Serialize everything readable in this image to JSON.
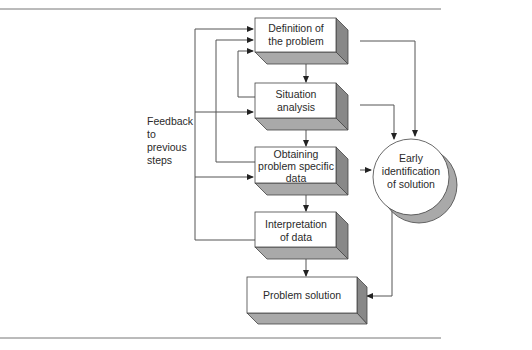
{
  "diagram": {
    "boxes": [
      {
        "id": "definition",
        "lines": [
          "Definition of",
          "the problem"
        ]
      },
      {
        "id": "situation",
        "lines": [
          "Situation",
          "analysis"
        ]
      },
      {
        "id": "obtaining",
        "lines": [
          "Obtaining",
          "problem specific",
          "data"
        ]
      },
      {
        "id": "interpretation",
        "lines": [
          "Interpretation",
          "of data"
        ]
      },
      {
        "id": "solution",
        "lines": [
          "Problem solution"
        ]
      }
    ],
    "circle": {
      "lines": [
        "Early",
        "identification",
        "of solution"
      ]
    },
    "feedback_label": [
      "Feedback",
      "to",
      "previous",
      "steps"
    ],
    "colors": {
      "line": "#555555",
      "box_face": "#ffffff",
      "box_side": "#8a8a8a",
      "box_bottom": "#a8a8a8",
      "rule": "#777777"
    }
  }
}
